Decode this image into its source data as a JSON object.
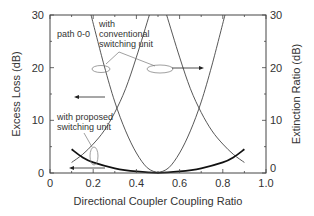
{
  "chart_data": {
    "type": "line",
    "title": "",
    "xlabel": "Directional Coupler Coupling Ratio",
    "ylabel": "Excess Loss (dB)",
    "ylabel_right": "Extinction Ratio (dB)",
    "xlim": [
      0,
      1.0
    ],
    "ylim": [
      0,
      30
    ],
    "ylim_right": [
      0,
      30
    ],
    "x_ticks": [
      "0",
      "0.2",
      "0.4",
      "0.6",
      "0.8",
      "1.0"
    ],
    "y_ticks": [
      "0",
      "10",
      "20",
      "30"
    ],
    "y_ticks_right": [
      "0",
      "10",
      "20",
      "30"
    ],
    "grid": false,
    "legend": null,
    "annotations": [
      {
        "text": "path 0-0",
        "x": 0.05,
        "y": 27
      },
      {
        "text": "with\nconventional\nswitching unit",
        "x": 0.23,
        "y": 27.5
      },
      {
        "text": "with proposed\nswitching unit",
        "x": 0.07,
        "y": 11
      },
      {
        "text": "arrow-left (excess loss axis)",
        "x": 0.17,
        "y": 15
      },
      {
        "text": "arrow-right (extinction ratio axis)",
        "x": 0.6,
        "y": 20
      },
      {
        "text": "arrow-left (excess loss axis)",
        "x": 0.15,
        "y": 1.2
      }
    ],
    "series": [
      {
        "name": "Excess loss, conventional switching unit (path 0-0)",
        "axis": "left",
        "x": [
          0.19,
          0.25,
          0.3,
          0.35,
          0.4,
          0.45,
          0.5
        ],
        "y": [
          30,
          20.5,
          13.5,
          8,
          3.8,
          1.0,
          0
        ]
      },
      {
        "name": "Extinction ratio, conventional switching unit",
        "axis": "right",
        "x": [
          0.5,
          0.55,
          0.6,
          0.65,
          0.7,
          0.75,
          0.81
        ],
        "y": [
          0,
          1.0,
          3.8,
          8,
          13.5,
          20.5,
          30
        ]
      },
      {
        "name": "Extinction ratio, proposed switching unit (rising)",
        "axis": "right",
        "x": [
          0.1,
          0.15,
          0.2,
          0.25,
          0.3,
          0.35,
          0.4,
          0.46
        ],
        "y": [
          2,
          3.5,
          5.5,
          8,
          11.5,
          16,
          22,
          30
        ]
      },
      {
        "name": "Extinction ratio, proposed switching unit (falling)",
        "axis": "right",
        "x": [
          0.54,
          0.6,
          0.65,
          0.7,
          0.75,
          0.8,
          0.85,
          0.9
        ],
        "y": [
          30,
          22,
          16,
          11.5,
          8,
          5.5,
          3.5,
          2
        ]
      },
      {
        "name": "Excess loss, proposed switching unit",
        "axis": "left",
        "x": [
          0.1,
          0.15,
          0.2,
          0.3,
          0.4,
          0.5,
          0.6,
          0.7,
          0.8,
          0.85,
          0.9
        ],
        "y": [
          4.5,
          3.0,
          2.0,
          0.9,
          0.3,
          0.05,
          0.3,
          0.9,
          2.0,
          3.0,
          4.5
        ]
      }
    ]
  }
}
